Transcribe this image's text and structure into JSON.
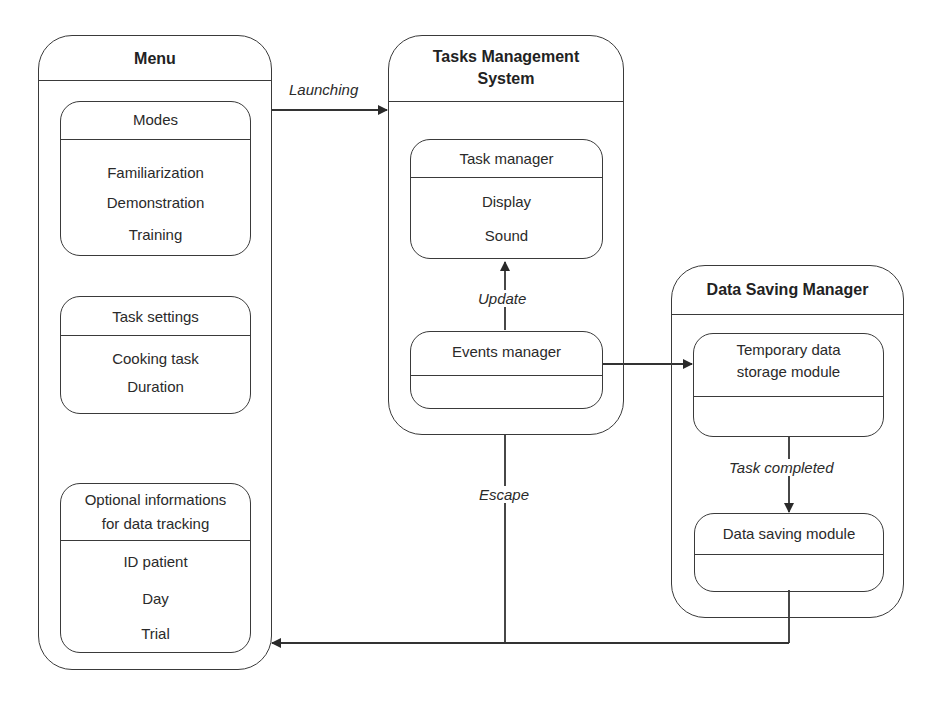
{
  "menu": {
    "title": "Menu",
    "modes": {
      "title": "Modes",
      "items": [
        "Familiarization",
        "Demonstration",
        "Training"
      ]
    },
    "task_settings": {
      "title": "Task settings",
      "items": [
        "Cooking task",
        "Duration"
      ]
    },
    "optional_info": {
      "title_line1": "Optional informations",
      "title_line2": "for data tracking",
      "items": [
        "ID patient",
        "Day",
        "Trial"
      ]
    }
  },
  "tasks_management_system": {
    "title_line1": "Tasks Management",
    "title_line2": "System",
    "task_manager": {
      "title": "Task manager",
      "items": [
        "Display",
        "Sound"
      ]
    },
    "events_manager": {
      "title": "Events manager"
    }
  },
  "data_saving_manager": {
    "title": "Data Saving Manager",
    "temporary_storage": {
      "title_line1": "Temporary data",
      "title_line2": "storage module"
    },
    "data_saving_module": {
      "title": "Data saving module"
    }
  },
  "edges": {
    "launching": "Launching",
    "update": "Update",
    "escape": "Escape",
    "task_completed": "Task completed"
  },
  "colors": {
    "stroke": "#3a3a3a",
    "text": "#2a2a2a",
    "background": "#ffffff"
  }
}
